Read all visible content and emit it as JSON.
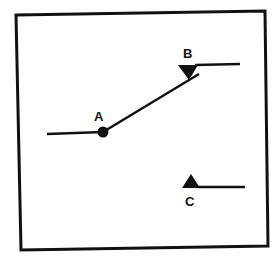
{
  "diagram": {
    "type": "switch-schematic",
    "colors": {
      "background": "#ffffff",
      "ink": "#111111"
    },
    "frame": {
      "points": [
        [
          16,
          15
        ],
        [
          265,
          11
        ],
        [
          268,
          246
        ],
        [
          21,
          250
        ]
      ]
    },
    "terminals": {
      "A": {
        "label": "A",
        "symbol": "filled-circle",
        "x": 103,
        "y": 132,
        "label_x": 99,
        "label_y": 121
      },
      "B": {
        "label": "B",
        "symbol": "down-triangle",
        "x": 188,
        "y": 66,
        "label_x": 188,
        "label_y": 58
      },
      "C": {
        "label": "C",
        "symbol": "up-triangle",
        "x": 191,
        "y": 187,
        "label_x": 190,
        "label_y": 206
      }
    },
    "lines": {
      "lead_a": {
        "x1": 47,
        "y1": 134,
        "x2": 103,
        "y2": 132
      },
      "arm": {
        "x1": 103,
        "y1": 132,
        "x2": 199,
        "y2": 74
      },
      "lead_b": {
        "x1": 195,
        "y1": 65,
        "x2": 240,
        "y2": 64
      },
      "lead_c": {
        "x1": 198,
        "y1": 187,
        "x2": 245,
        "y2": 187
      }
    }
  }
}
